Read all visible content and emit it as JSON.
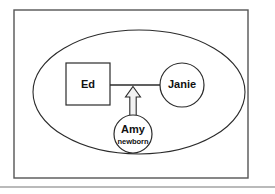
{
  "figure": {
    "background_color": "#ffffff",
    "frame_color": "#555555",
    "stroke_color": "#2b2b2b"
  },
  "frame": {
    "x": 14,
    "y": 10,
    "width": 234,
    "height": 168
  },
  "footer_rule": {
    "y": 187,
    "x1": 0,
    "x2": 275
  },
  "boundary": {
    "label": "family-boundary-ellipse",
    "cx": 139,
    "cy": 92,
    "rx": 106,
    "ry": 62
  },
  "nodes": {
    "ed": {
      "name": "Ed",
      "shape": "square",
      "x": 66,
      "y": 63,
      "width": 44,
      "height": 42
    },
    "janie": {
      "name": "Janie",
      "shape": "circle",
      "cx": 182,
      "cy": 85,
      "r": 22
    },
    "amy": {
      "name": "Amy",
      "note": "newborn",
      "shape": "circle",
      "cx": 133,
      "cy": 134,
      "r": 19
    }
  },
  "links": {
    "marriage_line": {
      "label": "marriage-line",
      "x1": 110,
      "y1": 85,
      "x2": 160,
      "y2": 85
    },
    "child_arrow": {
      "label": "child-influence-arrow",
      "direction": "up",
      "from": "Amy",
      "to": "marriage-line",
      "tip_y": 87,
      "base_y": 115,
      "shaft_half_width": 3.2,
      "head_half_width": 7.5,
      "head_height": 10,
      "center_x": 133
    }
  }
}
